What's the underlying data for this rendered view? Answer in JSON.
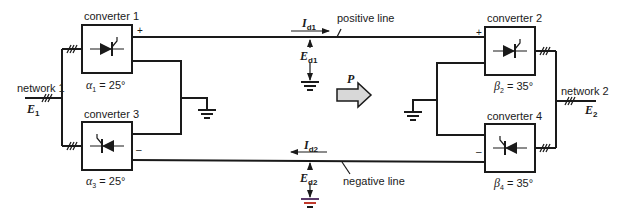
{
  "diagram": {
    "type": "HVDC bipolar transmission schematic",
    "colors": {
      "line": "#1a1a1a",
      "power_arrow_fill": "#d8d8d8",
      "ground_accent": "#c0392b"
    },
    "networks": [
      {
        "id": "network1",
        "label": "network 1",
        "emf": "E",
        "emf_sub": "1"
      },
      {
        "id": "network2",
        "label": "network 2",
        "emf": "E",
        "emf_sub": "2"
      }
    ],
    "converters": [
      {
        "id": "converter1",
        "label": "converter 1",
        "angle_symbol": "α",
        "angle_sub": "1",
        "angle_value": "= 25°",
        "polarity": "+"
      },
      {
        "id": "converter2",
        "label": "converter 2",
        "angle_symbol": "β",
        "angle_sub": "2",
        "angle_value": "= 35°",
        "polarity": "+"
      },
      {
        "id": "converter3",
        "label": "converter 3",
        "angle_symbol": "α",
        "angle_sub": "3",
        "angle_value": "= 25°",
        "polarity": "–"
      },
      {
        "id": "converter4",
        "label": "converter 4",
        "angle_symbol": "β",
        "angle_sub": "4",
        "angle_value": "= 35°",
        "polarity": "–"
      }
    ],
    "lines": {
      "positive": {
        "label": "positive line",
        "current": "I",
        "current_sub": "d1",
        "voltage": "E",
        "voltage_sub": "d1"
      },
      "negative": {
        "label": "negative line",
        "current": "I",
        "current_sub": "d2",
        "voltage": "E",
        "voltage_sub": "d2"
      }
    },
    "power_flow": {
      "label": "P",
      "direction": "right"
    }
  }
}
